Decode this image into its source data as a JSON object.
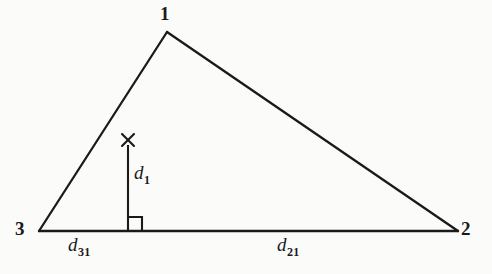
{
  "figure": {
    "type": "geometry-diagram",
    "background_color": "#fbfbfa",
    "stroke_color": "#1a1a1a",
    "stroke_width": 2
  },
  "vertices": [
    {
      "id": "1",
      "label": "1",
      "x": 167,
      "y": 32
    },
    {
      "id": "2",
      "label": "2",
      "x": 458,
      "y": 231
    },
    {
      "id": "3",
      "label": "3",
      "x": 39,
      "y": 231
    }
  ],
  "edges": [
    {
      "name": "edge-3-1",
      "from": "3",
      "to": "1"
    },
    {
      "name": "edge-1-2",
      "from": "1",
      "to": "2"
    },
    {
      "name": "edge-3-2",
      "from": "3",
      "to": "2"
    }
  ],
  "perpendicular": {
    "name": "perpendicular-segment",
    "label": "d",
    "subscript": "1",
    "top_x": 128,
    "top_y": 146,
    "foot_x": 128,
    "foot_y": 231,
    "marker": "x-mark",
    "marker_x": 128,
    "marker_y": 140,
    "right_angle_size": 14
  },
  "segments": [
    {
      "name": "segment-d31",
      "label": "d",
      "subscript": "31",
      "from": "3",
      "to": "foot"
    },
    {
      "name": "segment-d21",
      "label": "d",
      "subscript": "21",
      "from": "foot",
      "to": "2"
    }
  ],
  "labels": {
    "vertex_1": "1",
    "vertex_2": "2",
    "vertex_3": "3",
    "d_base": "d",
    "d1_sub": "1",
    "d31_sub": "31",
    "d21_sub": "21"
  }
}
